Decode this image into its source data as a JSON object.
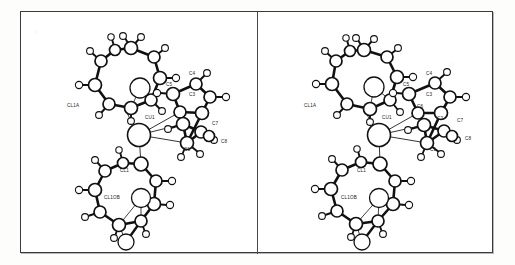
{
  "figure": {
    "kind": "ortep-stereo-pair",
    "panel_count": 2,
    "background_color": "#ffffff",
    "line_color": "#111111",
    "frame_color": "#3a3a3a",
    "atom_fill": "#ffffff"
  },
  "panels": [
    {
      "id": "left",
      "name": "stereo-view-left"
    },
    {
      "id": "right",
      "name": "stereo-view-right"
    }
  ],
  "labels": {
    "left": [
      {
        "text": "CL1A",
        "x": 46,
        "y": 95,
        "name": "atom-label-cl1a"
      },
      {
        "text": "CU1",
        "x": 124,
        "y": 107,
        "name": "atom-label-cu1"
      },
      {
        "text": "C4",
        "x": 168,
        "y": 63,
        "name": "atom-label-c4"
      },
      {
        "text": "C5",
        "x": 145,
        "y": 74,
        "name": "atom-label-c5"
      },
      {
        "text": "C3",
        "x": 168,
        "y": 84,
        "name": "atom-label-c3"
      },
      {
        "text": "C7",
        "x": 191,
        "y": 113,
        "name": "atom-label-c7"
      },
      {
        "text": "C8",
        "x": 200,
        "y": 131,
        "name": "atom-label-c8"
      },
      {
        "text": "C1",
        "x": 163,
        "y": 139,
        "name": "atom-label-c1"
      },
      {
        "text": "CL1",
        "x": 99,
        "y": 160,
        "name": "atom-label-cl1"
      },
      {
        "text": "CL1OB",
        "x": 83,
        "y": 187,
        "name": "atom-label-cl1ob"
      }
    ],
    "right": [
      {
        "text": "CL1A",
        "x": 46,
        "y": 95,
        "name": "atom-label-cl1a"
      },
      {
        "text": "CU1",
        "x": 124,
        "y": 107,
        "name": "atom-label-cu1"
      },
      {
        "text": "C4",
        "x": 168,
        "y": 63,
        "name": "atom-label-c4"
      },
      {
        "text": "C5",
        "x": 145,
        "y": 74,
        "name": "atom-label-c5"
      },
      {
        "text": "C3",
        "x": 168,
        "y": 84,
        "name": "atom-label-c3"
      },
      {
        "text": "C6",
        "x": 159,
        "y": 96,
        "name": "atom-label-c6"
      },
      {
        "text": "C2",
        "x": 179,
        "y": 108,
        "name": "atom-label-c2"
      },
      {
        "text": "C7",
        "x": 199,
        "y": 110,
        "name": "atom-label-c7"
      },
      {
        "text": "C8",
        "x": 207,
        "y": 128,
        "name": "atom-label-c8"
      },
      {
        "text": "C1",
        "x": 172,
        "y": 139,
        "name": "atom-label-c1"
      },
      {
        "text": "CL1",
        "x": 99,
        "y": 160,
        "name": "atom-label-cl1"
      },
      {
        "text": "CL1OB",
        "x": 83,
        "y": 187,
        "name": "atom-label-cl1ob"
      }
    ]
  },
  "geometry": {
    "left": {
      "metal": {
        "cx": 118,
        "cy": 123,
        "r": 11.5,
        "name": "atom-cu1"
      },
      "ring_top": {
        "name": "macrocycle-top",
        "nodes": [
          {
            "cx": 110,
            "cy": 36,
            "r": 6.5
          },
          {
            "cx": 133,
            "cy": 45,
            "r": 6.0
          },
          {
            "cx": 139,
            "cy": 66,
            "r": 6.5
          },
          {
            "cx": 130,
            "cy": 88,
            "r": 6.0
          },
          {
            "cx": 110,
            "cy": 96,
            "r": 6.5
          },
          {
            "cx": 88,
            "cy": 92,
            "r": 6.0
          },
          {
            "cx": 74,
            "cy": 73,
            "r": 6.5
          },
          {
            "cx": 80,
            "cy": 49,
            "r": 6.0
          },
          {
            "cx": 94,
            "cy": 38,
            "r": 5.5
          }
        ],
        "center_atom": {
          "cx": 119,
          "cy": 76,
          "r": 10.0
        },
        "hydrogens": [
          {
            "x1": 110,
            "y1": 36,
            "x2": 104,
            "y2": 26,
            "cx": 102,
            "cy": 24,
            "r": 3.4
          },
          {
            "x1": 110,
            "y1": 36,
            "x2": 118,
            "y2": 27,
            "cx": 120,
            "cy": 25,
            "r": 3.4
          },
          {
            "x1": 133,
            "y1": 45,
            "x2": 142,
            "y2": 38,
            "cx": 144,
            "cy": 36,
            "r": 3.4
          },
          {
            "x1": 139,
            "y1": 66,
            "x2": 152,
            "y2": 66,
            "cx": 155,
            "cy": 66,
            "r": 3.6
          },
          {
            "x1": 130,
            "y1": 88,
            "x2": 139,
            "y2": 97,
            "cx": 141,
            "cy": 99,
            "r": 3.4
          },
          {
            "x1": 110,
            "y1": 96,
            "x2": 110,
            "y2": 107,
            "cx": 110,
            "cy": 109,
            "r": 3.4
          },
          {
            "x1": 88,
            "y1": 92,
            "x2": 80,
            "y2": 101,
            "cx": 78,
            "cy": 103,
            "r": 3.4
          },
          {
            "x1": 74,
            "y1": 73,
            "x2": 61,
            "y2": 73,
            "cx": 58,
            "cy": 73,
            "r": 3.6
          },
          {
            "x1": 80,
            "y1": 49,
            "x2": 71,
            "y2": 41,
            "cx": 69,
            "cy": 39,
            "r": 3.4
          },
          {
            "x1": 94,
            "y1": 38,
            "x2": 91,
            "y2": 27,
            "cx": 90,
            "cy": 25,
            "r": 3.2
          }
        ]
      },
      "ring_bottom": {
        "name": "macrocycle-bottom",
        "nodes": [
          {
            "cx": 120,
            "cy": 152,
            "r": 7.0
          },
          {
            "cx": 135,
            "cy": 169,
            "r": 6.0
          },
          {
            "cx": 133,
            "cy": 192,
            "r": 6.5
          },
          {
            "cx": 120,
            "cy": 209,
            "r": 6.0
          },
          {
            "cx": 98,
            "cy": 213,
            "r": 6.5
          },
          {
            "cx": 79,
            "cy": 200,
            "r": 6.0
          },
          {
            "cx": 74,
            "cy": 178,
            "r": 6.5
          },
          {
            "cx": 84,
            "cy": 159,
            "r": 6.0
          },
          {
            "cx": 102,
            "cy": 151,
            "r": 5.5
          }
        ],
        "center_atom": {
          "cx": 120,
          "cy": 186,
          "r": 9.5
        },
        "lower_atom": {
          "cx": 105,
          "cy": 230,
          "r": 8.0
        },
        "hydrogens": [
          {
            "x1": 135,
            "y1": 169,
            "x2": 148,
            "y2": 169,
            "cx": 151,
            "cy": 169,
            "r": 3.6
          },
          {
            "x1": 133,
            "y1": 192,
            "x2": 146,
            "y2": 193,
            "cx": 149,
            "cy": 193,
            "r": 3.6
          },
          {
            "x1": 120,
            "y1": 209,
            "x2": 124,
            "y2": 220,
            "cx": 125,
            "cy": 222,
            "r": 3.4
          },
          {
            "x1": 98,
            "y1": 213,
            "x2": 94,
            "y2": 224,
            "cx": 93,
            "cy": 226,
            "r": 3.4
          },
          {
            "x1": 79,
            "y1": 200,
            "x2": 67,
            "y2": 204,
            "cx": 64,
            "cy": 205,
            "r": 3.4
          },
          {
            "x1": 74,
            "y1": 178,
            "x2": 61,
            "y2": 178,
            "cx": 58,
            "cy": 178,
            "r": 3.6
          },
          {
            "x1": 84,
            "y1": 159,
            "x2": 76,
            "y2": 150,
            "cx": 74,
            "cy": 148,
            "r": 3.4
          },
          {
            "x1": 102,
            "y1": 151,
            "x2": 99,
            "y2": 140,
            "cx": 98,
            "cy": 138,
            "r": 3.2
          }
        ]
      },
      "organic": {
        "name": "cyclopentadienyl-ligand",
        "nodes": [
          {
            "cx": 175,
            "cy": 72,
            "r": 6.0
          },
          {
            "cx": 189,
            "cy": 85,
            "r": 6.0
          },
          {
            "cx": 181,
            "cy": 101,
            "r": 6.5
          },
          {
            "cx": 159,
            "cy": 100,
            "r": 6.0
          },
          {
            "cx": 152,
            "cy": 82,
            "r": 6.5
          },
          {
            "cx": 162,
            "cy": 112,
            "r": 6.5
          },
          {
            "cx": 180,
            "cy": 120,
            "r": 6.0
          },
          {
            "cx": 188,
            "cy": 124,
            "r": 5.5
          },
          {
            "cx": 166,
            "cy": 131,
            "r": 6.5
          }
        ],
        "hydrogens": [
          {
            "x1": 175,
            "y1": 72,
            "x2": 184,
            "y2": 63,
            "cx": 186,
            "cy": 61,
            "r": 3.4
          },
          {
            "x1": 189,
            "y1": 85,
            "x2": 202,
            "y2": 85,
            "cx": 205,
            "cy": 85,
            "r": 3.6
          },
          {
            "x1": 152,
            "y1": 82,
            "x2": 139,
            "y2": 81,
            "cx": 136,
            "cy": 81,
            "r": 3.6
          },
          {
            "x1": 180,
            "y1": 120,
            "x2": 191,
            "y2": 126,
            "cx": 193,
            "cy": 128,
            "r": 3.4
          },
          {
            "x1": 166,
            "y1": 131,
            "x2": 161,
            "y2": 143,
            "cx": 160,
            "cy": 145,
            "r": 3.4
          },
          {
            "x1": 166,
            "y1": 131,
            "x2": 177,
            "y2": 140,
            "cx": 179,
            "cy": 142,
            "r": 3.4
          },
          {
            "x1": 162,
            "y1": 112,
            "x2": 150,
            "y2": 116,
            "cx": 147,
            "cy": 117,
            "r": 3.4
          }
        ]
      },
      "coordination_bonds": [
        {
          "x1": 118,
          "y1": 123,
          "x2": 106,
          "y2": 101,
          "name": "bond-cu1-cl1a"
        },
        {
          "x1": 118,
          "y1": 123,
          "x2": 120,
          "y2": 152,
          "name": "bond-cu1-cl1"
        },
        {
          "x1": 118,
          "y1": 123,
          "x2": 159,
          "y2": 100,
          "name": "bond-cu1-c3"
        },
        {
          "x1": 118,
          "y1": 123,
          "x2": 162,
          "y2": 112,
          "name": "bond-cu1-c2"
        },
        {
          "x1": 118,
          "y1": 123,
          "x2": 166,
          "y2": 131,
          "name": "bond-cu1-c1"
        }
      ]
    },
    "right": {
      "metal": {
        "cx": 121,
        "cy": 123,
        "r": 11.5,
        "name": "atom-cu1"
      },
      "ring_top": {
        "name": "macrocycle-top",
        "nodes": [
          {
            "cx": 106,
            "cy": 38,
            "r": 6.5
          },
          {
            "cx": 129,
            "cy": 45,
            "r": 6.0
          },
          {
            "cx": 139,
            "cy": 65,
            "r": 6.5
          },
          {
            "cx": 132,
            "cy": 88,
            "r": 6.0
          },
          {
            "cx": 112,
            "cy": 97,
            "r": 6.5
          },
          {
            "cx": 89,
            "cy": 92,
            "r": 6.0
          },
          {
            "cx": 74,
            "cy": 72,
            "r": 6.5
          },
          {
            "cx": 78,
            "cy": 49,
            "r": 6.0
          },
          {
            "cx": 92,
            "cy": 39,
            "r": 5.5
          }
        ],
        "center_atom": {
          "cx": 116,
          "cy": 75,
          "r": 10.0
        },
        "hydrogens": [
          {
            "x1": 106,
            "y1": 38,
            "x2": 100,
            "y2": 28,
            "cx": 98,
            "cy": 26,
            "r": 3.4
          },
          {
            "x1": 106,
            "y1": 38,
            "x2": 114,
            "y2": 29,
            "cx": 116,
            "cy": 27,
            "r": 3.4
          },
          {
            "x1": 129,
            "y1": 45,
            "x2": 138,
            "y2": 38,
            "cx": 140,
            "cy": 36,
            "r": 3.4
          },
          {
            "x1": 139,
            "y1": 65,
            "x2": 152,
            "y2": 65,
            "cx": 155,
            "cy": 65,
            "r": 3.6
          },
          {
            "x1": 132,
            "y1": 88,
            "x2": 140,
            "y2": 98,
            "cx": 142,
            "cy": 100,
            "r": 3.4
          },
          {
            "x1": 112,
            "y1": 97,
            "x2": 112,
            "y2": 108,
            "cx": 112,
            "cy": 110,
            "r": 3.4
          },
          {
            "x1": 89,
            "y1": 92,
            "x2": 81,
            "y2": 101,
            "cx": 79,
            "cy": 103,
            "r": 3.4
          },
          {
            "x1": 74,
            "y1": 72,
            "x2": 61,
            "y2": 72,
            "cx": 58,
            "cy": 72,
            "r": 3.6
          },
          {
            "x1": 78,
            "y1": 49,
            "x2": 69,
            "y2": 41,
            "cx": 67,
            "cy": 39,
            "r": 3.4
          },
          {
            "x1": 92,
            "y1": 39,
            "x2": 89,
            "y2": 28,
            "cx": 88,
            "cy": 26,
            "r": 3.2
          }
        ]
      },
      "ring_bottom": {
        "name": "macrocycle-bottom",
        "nodes": [
          {
            "cx": 122,
            "cy": 152,
            "r": 7.0
          },
          {
            "cx": 137,
            "cy": 169,
            "r": 6.0
          },
          {
            "cx": 135,
            "cy": 192,
            "r": 6.5
          },
          {
            "cx": 120,
            "cy": 209,
            "r": 6.0
          },
          {
            "cx": 98,
            "cy": 212,
            "r": 6.5
          },
          {
            "cx": 79,
            "cy": 199,
            "r": 6.0
          },
          {
            "cx": 73,
            "cy": 177,
            "r": 6.5
          },
          {
            "cx": 84,
            "cy": 158,
            "r": 6.0
          },
          {
            "cx": 103,
            "cy": 150,
            "r": 5.5
          }
        ],
        "center_atom": {
          "cx": 121,
          "cy": 186,
          "r": 9.5
        },
        "lower_atom": {
          "cx": 104,
          "cy": 230,
          "r": 8.0
        },
        "hydrogens": [
          {
            "x1": 137,
            "y1": 169,
            "x2": 150,
            "y2": 169,
            "cx": 153,
            "cy": 169,
            "r": 3.6
          },
          {
            "x1": 135,
            "y1": 192,
            "x2": 148,
            "y2": 193,
            "cx": 151,
            "cy": 193,
            "r": 3.6
          },
          {
            "x1": 120,
            "y1": 209,
            "x2": 124,
            "y2": 220,
            "cx": 125,
            "cy": 222,
            "r": 3.4
          },
          {
            "x1": 98,
            "y1": 212,
            "x2": 94,
            "y2": 223,
            "cx": 93,
            "cy": 225,
            "r": 3.4
          },
          {
            "x1": 79,
            "y1": 199,
            "x2": 67,
            "y2": 203,
            "cx": 64,
            "cy": 204,
            "r": 3.4
          },
          {
            "x1": 73,
            "y1": 177,
            "x2": 60,
            "y2": 177,
            "cx": 57,
            "cy": 177,
            "r": 3.6
          },
          {
            "x1": 84,
            "y1": 158,
            "x2": 76,
            "y2": 149,
            "cx": 74,
            "cy": 147,
            "r": 3.4
          },
          {
            "x1": 103,
            "y1": 150,
            "x2": 100,
            "y2": 139,
            "cx": 99,
            "cy": 137,
            "r": 3.2
          }
        ]
      },
      "organic": {
        "name": "cyclopentadienyl-ligand",
        "nodes": [
          {
            "cx": 177,
            "cy": 71,
            "r": 6.0
          },
          {
            "cx": 192,
            "cy": 85,
            "r": 6.0
          },
          {
            "cx": 183,
            "cy": 101,
            "r": 6.5
          },
          {
            "cx": 160,
            "cy": 101,
            "r": 6.0
          },
          {
            "cx": 151,
            "cy": 82,
            "r": 6.5
          },
          {
            "cx": 166,
            "cy": 113,
            "r": 6.5
          },
          {
            "cx": 186,
            "cy": 119,
            "r": 6.0
          },
          {
            "cx": 194,
            "cy": 124,
            "r": 5.5
          },
          {
            "cx": 169,
            "cy": 131,
            "r": 6.5
          }
        ],
        "hydrogens": [
          {
            "x1": 177,
            "y1": 71,
            "x2": 187,
            "y2": 62,
            "cx": 189,
            "cy": 60,
            "r": 3.4
          },
          {
            "x1": 192,
            "y1": 85,
            "x2": 205,
            "y2": 85,
            "cx": 208,
            "cy": 85,
            "r": 3.6
          },
          {
            "x1": 151,
            "y1": 82,
            "x2": 138,
            "y2": 81,
            "cx": 135,
            "cy": 81,
            "r": 3.6
          },
          {
            "x1": 186,
            "y1": 119,
            "x2": 197,
            "y2": 126,
            "cx": 199,
            "cy": 128,
            "r": 3.4
          },
          {
            "x1": 169,
            "y1": 131,
            "x2": 164,
            "y2": 143,
            "cx": 163,
            "cy": 145,
            "r": 3.4
          },
          {
            "x1": 169,
            "y1": 131,
            "x2": 181,
            "y2": 140,
            "cx": 183,
            "cy": 142,
            "r": 3.4
          },
          {
            "x1": 166,
            "y1": 113,
            "x2": 153,
            "y2": 117,
            "cx": 150,
            "cy": 118,
            "r": 3.4
          }
        ]
      },
      "coordination_bonds": [
        {
          "x1": 121,
          "y1": 123,
          "x2": 108,
          "y2": 101,
          "name": "bond-cu1-cl1a"
        },
        {
          "x1": 121,
          "y1": 123,
          "x2": 122,
          "y2": 152,
          "name": "bond-cu1-cl1"
        },
        {
          "x1": 121,
          "y1": 123,
          "x2": 160,
          "y2": 101,
          "name": "bond-cu1-c3"
        },
        {
          "x1": 121,
          "y1": 123,
          "x2": 166,
          "y2": 113,
          "name": "bond-cu1-c2"
        },
        {
          "x1": 121,
          "y1": 123,
          "x2": 169,
          "y2": 131,
          "name": "bond-cu1-c1"
        }
      ]
    }
  }
}
